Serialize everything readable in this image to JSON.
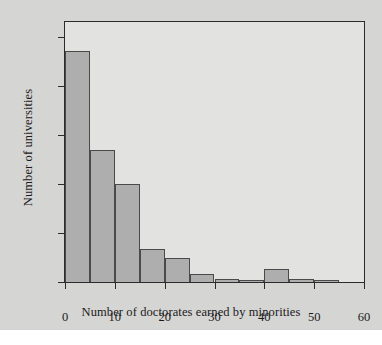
{
  "figure": {
    "background_color": "#d5d5d4",
    "plot_background_color": "#e2e2e1",
    "frame_color": "#2b2b2b",
    "bar_fill_color": "#aeaeae",
    "bar_edge_color": "#4a4a4a"
  },
  "chart_data": {
    "type": "bar",
    "title": "",
    "xlabel": "Number of doctorates earned by minorities",
    "ylabel": "Number of universities",
    "xlim": [
      0,
      60
    ],
    "ylim": [
      0,
      53
    ],
    "grid": false,
    "legend": null,
    "bin_width": 5,
    "bin_edges": [
      0,
      5,
      10,
      15,
      20,
      25,
      30,
      35,
      40,
      45,
      50,
      55,
      60
    ],
    "categories": [
      "0-5",
      "5-10",
      "10-15",
      "15-20",
      "20-25",
      "25-30",
      "30-35",
      "35-40",
      "40-45",
      "45-50",
      "50-55",
      "55-60"
    ],
    "values": [
      47,
      27,
      20,
      6.7,
      4.8,
      1.6,
      0.6,
      0.4,
      2.6,
      0.6,
      0.5,
      0
    ],
    "xticks": [
      0,
      10,
      20,
      30,
      40,
      50,
      60
    ],
    "xtick_labels": [
      "0",
      "10",
      "20",
      "30",
      "40",
      "50",
      "60"
    ],
    "yticks": [
      0,
      10,
      20,
      30,
      40,
      50
    ],
    "ytick_labels": [
      "0",
      "10",
      "20",
      "30",
      "40",
      "50"
    ]
  }
}
